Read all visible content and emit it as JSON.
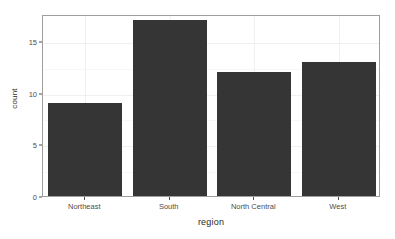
{
  "chart_data": {
    "type": "bar",
    "title": "",
    "subtitle": "",
    "xlabel": "region",
    "ylabel": "count",
    "categories": [
      "Northeast",
      "South",
      "North Central",
      "West"
    ],
    "values": [
      9,
      17,
      12,
      13
    ],
    "series": [
      {
        "name": "count",
        "values": [
          9,
          17,
          12,
          13
        ]
      }
    ],
    "ylim": [
      0,
      17.6
    ],
    "y_ticks": [
      0,
      5,
      10,
      15
    ],
    "y_tick_labels": [
      "0",
      "5",
      "10",
      "15"
    ],
    "y_minor_ticks": [
      2.5,
      7.5,
      12.5
    ],
    "grid": true,
    "grid_axis": "both",
    "legend": "none",
    "annotations": [],
    "bar_color": "#353535",
    "panel_background": "#ffffff",
    "panel_border_color": "#9e9e9e",
    "grid_color": "#f0f0f2",
    "axis_text_color": "#4d4d4d",
    "axis_title_color": "#2b2b2b"
  }
}
